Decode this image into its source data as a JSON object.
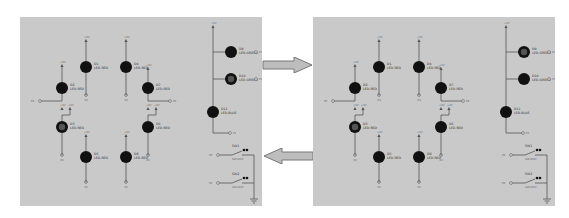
{
  "figure": {
    "arrows": [
      {
        "direction": "right",
        "name": "forward-arrow"
      },
      {
        "direction": "left",
        "name": "backward-arrow"
      }
    ],
    "colors": {
      "panel_bg": "#c9c9c9",
      "wire": "#555555",
      "led_on": "#111111",
      "arrow_fill": "#bdbdbd",
      "arrow_stroke": "#777777"
    },
    "panels": [
      {
        "name": "schematic-left",
        "lit_hollow": [
          "D3",
          "D10"
        ]
      },
      {
        "name": "schematic-right",
        "lit_hollow": [
          "D3",
          "D9"
        ]
      }
    ],
    "components": {
      "power_label": "+5V",
      "gnd_label": "0V",
      "leds": [
        {
          "ref": "D1",
          "type": "LED-RED"
        },
        {
          "ref": "D2",
          "type": "LED-RED"
        },
        {
          "ref": "D3",
          "type": "LED-RED"
        },
        {
          "ref": "D4",
          "type": "LED-RED"
        },
        {
          "ref": "D5",
          "type": "LED-RED"
        },
        {
          "ref": "D6",
          "type": "LED-RED"
        },
        {
          "ref": "D7",
          "type": "LED-RED"
        },
        {
          "ref": "D8",
          "type": "LED-RED"
        },
        {
          "ref": "D9",
          "type": "LED-GREEN"
        },
        {
          "ref": "D10",
          "type": "LED-GREEN"
        },
        {
          "ref": "D11",
          "type": "LED-BLUE"
        }
      ],
      "ports": [
        "P0",
        "P1",
        "P2",
        "P3"
      ],
      "switches": [
        {
          "ref": "SW1",
          "type": "SW-SPST"
        },
        {
          "ref": "SW2",
          "type": "SW-SPST"
        }
      ]
    }
  }
}
